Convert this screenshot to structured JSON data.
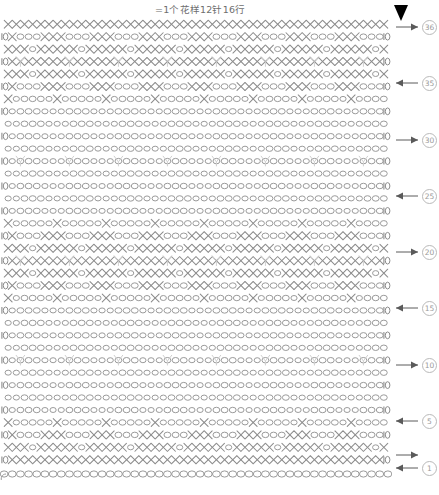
{
  "chart_data": {
    "type": "diagram",
    "title": "=1个花样12针16行",
    "subtitle": "",
    "xlabel": "",
    "ylabel": "",
    "diagram_kind": "crochet-stitch-chart",
    "pattern_repeat": {
      "stitches": 12,
      "rows": 16
    },
    "total_rows": 36,
    "stitches_per_row": 48,
    "grid": {
      "left": 0,
      "top": 18,
      "width": 392,
      "height": 462,
      "rows": 36,
      "columns": 48
    },
    "row_label_values": [
      1,
      5,
      10,
      15,
      20,
      25,
      30,
      36
    ],
    "row_labels": [
      {
        "row": 36,
        "text": "36",
        "direction": "right",
        "y": 9
      },
      {
        "row": 31,
        "text": "35",
        "direction": "left",
        "y": 65
      },
      {
        "row": 26,
        "text": "30",
        "direction": "right",
        "y": 122
      },
      {
        "row": 21,
        "text": "25",
        "direction": "left",
        "y": 178
      },
      {
        "row": 16,
        "text": "20",
        "direction": "right",
        "y": 234
      },
      {
        "row": 11,
        "text": "15",
        "direction": "left",
        "y": 290
      },
      {
        "row": 6,
        "text": "10",
        "direction": "right",
        "y": 347
      },
      {
        "row": 3,
        "text": "5",
        "direction": "left",
        "y": 403
      },
      {
        "row": 2,
        "text": "",
        "direction": "right",
        "y": 437
      },
      {
        "row": 1,
        "text": "1",
        "direction": "left",
        "y": 450
      }
    ],
    "symbols": [
      {
        "name": "single-crochet",
        "glyph": "X",
        "meaning": "短针 / single crochet"
      },
      {
        "name": "chain-stitch",
        "glyph": "oval",
        "meaning": "锁针 / chain"
      },
      {
        "name": "turning-chain",
        "glyph": "oval-bar",
        "meaning": "立起的锁针 / turning chain"
      },
      {
        "name": "picot-cluster",
        "glyph": "Y",
        "meaning": "枣形针 / cluster"
      },
      {
        "name": "start-marker",
        "glyph": "solid-triangle",
        "meaning": "起针位置 / start"
      }
    ],
    "colors": {
      "stitch": "#8c8c8c",
      "chain": "#9b9b9b",
      "cluster": "#cfcfcf",
      "label": "#9a9a9a",
      "label_border": "#b9b9b9",
      "arrow": "#5a5a5a",
      "marker": "#000000",
      "background": "#ffffff"
    },
    "legend_entries": [
      {
        "label": "=1个花样12针16行"
      }
    ]
  },
  "header": {
    "legend_text": "=1个花样12针16行"
  },
  "footer": {
    "note": ""
  },
  "marker": {
    "name": "start-marker"
  }
}
